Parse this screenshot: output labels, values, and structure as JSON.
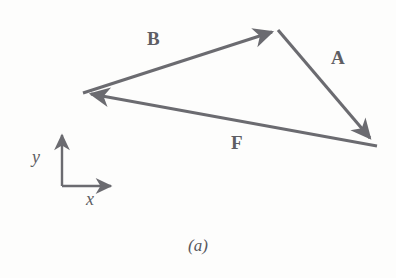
{
  "figure": {
    "caption": "(a)",
    "background_color": "#fdfdfc",
    "stroke_color": "#6b6b70",
    "text_color": "#5e5e63",
    "width": 396,
    "height": 278
  },
  "diagram": {
    "type": "vector-triangle",
    "vertices": {
      "left": [
        83,
        93
      ],
      "top": [
        278,
        30
      ],
      "right": [
        377,
        146
      ]
    },
    "vectors": [
      {
        "label": "B",
        "from": "left",
        "to": "top",
        "start": [
          83,
          93
        ],
        "end": [
          278,
          30
        ],
        "arrowhead_at": "end",
        "label_x": 147,
        "label_y": 29
      },
      {
        "label": "A",
        "from": "top",
        "to": "right",
        "start": [
          278,
          30
        ],
        "end": [
          377,
          146
        ],
        "arrowhead_at": "end",
        "label_x": 331,
        "label_y": 48
      },
      {
        "label": "F",
        "from": "right",
        "to": "left",
        "start": [
          377,
          146
        ],
        "end": [
          83,
          93
        ],
        "arrowhead_at": "end",
        "label_x": 231,
        "label_y": 133
      }
    ]
  },
  "axes": {
    "origin": [
      62,
      186
    ],
    "y_axis": {
      "label": "y",
      "tip": [
        62,
        128
      ],
      "label_x": 32,
      "label_y": 148
    },
    "x_axis": {
      "label": "x",
      "tip": [
        118,
        186
      ],
      "label_x": 86,
      "label_y": 190
    }
  }
}
